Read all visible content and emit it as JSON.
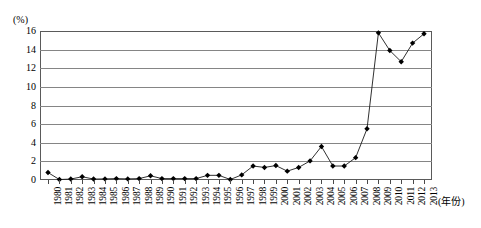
{
  "chart_data": {
    "type": "line",
    "title": "",
    "xlabel": "(年份)",
    "ylabel": "(%)",
    "ylim": [
      0,
      16
    ],
    "yticks": [
      0,
      2,
      4,
      6,
      8,
      10,
      12,
      14,
      16
    ],
    "grid": true,
    "legend": "none",
    "marker": "diamond",
    "categories": [
      "1980",
      "1981",
      "1982",
      "1983",
      "1984",
      "1985",
      "1986",
      "1987",
      "1988",
      "1989",
      "1990",
      "1991",
      "1992",
      "1993",
      "1994",
      "1995",
      "1996",
      "1997",
      "1998",
      "1999",
      "2000",
      "2001",
      "2002",
      "2003",
      "2004",
      "2005",
      "2006",
      "2007",
      "2008",
      "2009",
      "2010",
      "2011",
      "2012",
      "2013"
    ],
    "values": [
      0.8,
      0.05,
      0.1,
      0.35,
      0.1,
      0.12,
      0.15,
      0.12,
      0.15,
      0.45,
      0.15,
      0.15,
      0.15,
      0.15,
      0.5,
      0.5,
      0.05,
      0.55,
      1.5,
      1.35,
      1.55,
      0.95,
      1.35,
      2.05,
      3.6,
      1.5,
      1.5,
      2.4,
      5.5,
      15.8,
      13.9,
      12.7,
      14.7,
      15.7
    ],
    "series": [
      {
        "name": "比例",
        "values": [
          0.8,
          0.05,
          0.1,
          0.35,
          0.1,
          0.12,
          0.15,
          0.12,
          0.15,
          0.45,
          0.15,
          0.15,
          0.15,
          0.15,
          0.5,
          0.5,
          0.05,
          0.55,
          1.5,
          1.35,
          1.55,
          0.95,
          1.35,
          2.05,
          3.6,
          1.5,
          1.5,
          2.4,
          5.5,
          15.8,
          13.9,
          12.7,
          14.7,
          15.7
        ]
      }
    ],
    "colors": {
      "line": "#1a1a1a",
      "marker": "#000000",
      "grid": "#858585",
      "frame": "#5a5a5a",
      "background": "#ffffff"
    }
  }
}
